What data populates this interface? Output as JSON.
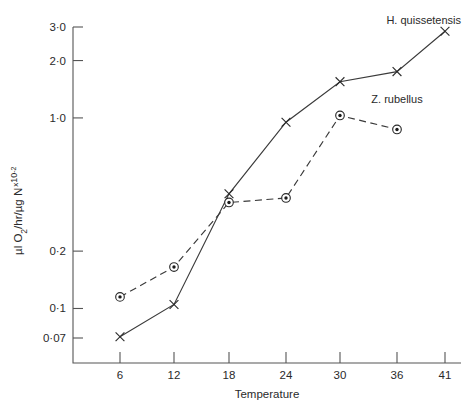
{
  "chart_data": {
    "type": "line",
    "title": "",
    "xlabel": "Temperature",
    "ylabel": "µl O₂/hr/µg N ˣ10⁻²",
    "ylabel_parts": {
      "main": "µl O",
      "sub_2": "2",
      "mid": "/hr/µg N",
      "sup_x": "x",
      "sup_exp": "10",
      "sup_power": "-2"
    },
    "x": [
      6,
      12,
      18,
      24,
      30,
      36,
      41
    ],
    "xticks": [
      6,
      12,
      18,
      24,
      30,
      36,
      41
    ],
    "xtick_labels": [
      "6",
      "12",
      "18",
      "24",
      "30",
      "36",
      "41"
    ],
    "xlim": [
      3,
      44
    ],
    "yscale": "log",
    "ylim": [
      0.062,
      3.3
    ],
    "yticks": [
      3.0,
      2.0,
      1.0,
      0.2,
      0.1,
      0.07
    ],
    "ytick_labels": [
      "3·0",
      "2·0",
      "1·0",
      "0·2",
      "0·1",
      "0·07"
    ],
    "grid": false,
    "legend": "inline-annotations",
    "series": [
      {
        "name": "H. quissetensis",
        "marker": "x",
        "linestyle": "solid",
        "color": "#2a2a2a",
        "x": [
          6,
          12,
          18,
          24,
          30,
          36,
          41
        ],
        "values": [
          0.071,
          0.105,
          0.4,
          0.95,
          1.55,
          1.75,
          2.85
        ]
      },
      {
        "name": "Z. rubellus",
        "marker": "circle-dot",
        "linestyle": "dashed",
        "color": "#2a2a2a",
        "x": [
          6,
          12,
          18,
          24,
          30,
          36
        ],
        "values": [
          0.115,
          0.165,
          0.36,
          0.38,
          1.03,
          0.87
        ]
      }
    ],
    "annotations": [
      {
        "text": "H. quissetensis",
        "x": 41,
        "y": 3.1,
        "anchor": "end"
      },
      {
        "text": "Z. rubellus",
        "x": 36,
        "y": 1.2,
        "anchor": "middle"
      }
    ]
  }
}
